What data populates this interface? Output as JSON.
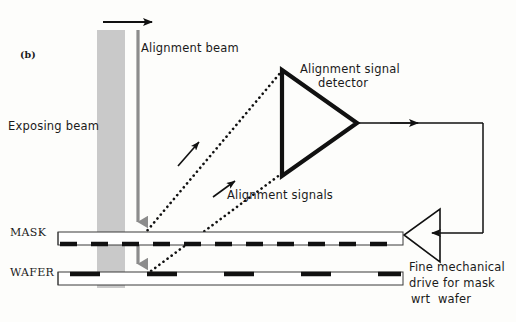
{
  "figure": {
    "panel_label": "(b)",
    "caption_absent": true
  },
  "labels": {
    "alignment_beam": "Alignment beam",
    "exposing_beam": "Exposing beam",
    "alignment_signal_detector_line1": "Alignment signal",
    "alignment_signal_detector_line2": "detector",
    "alignment_signals": "Alignment signals",
    "mask": "MASK",
    "wafer": "WAFER",
    "drive_line1": "Fine mechanical",
    "drive_line2": "drive for mask",
    "drive_line3": "wrt  wafer"
  },
  "colors": {
    "ink": "#1a1a1a",
    "beam_gray": "#c9c9c9",
    "alignment_beam_gray": "#8c8c8c",
    "background": "#fdfdfb",
    "dash_black": "#111111"
  },
  "geometry": {
    "exposing_beam": {
      "x": 97,
      "y": 30,
      "width": 28,
      "height": 258
    },
    "alignment_beam_line": {
      "x": 138,
      "y_top": 30,
      "y_bottom": 282
    },
    "top_arrow": {
      "x1": 103,
      "x2": 162,
      "y": 22
    },
    "mask_bar": {
      "x": 58,
      "y": 232,
      "width": 345,
      "height": 13
    },
    "wafer_bar": {
      "x": 58,
      "y": 272,
      "width": 345,
      "height": 13
    },
    "detector_triangle": {
      "apex_x": 358,
      "apex_y": 123,
      "back_x": 281,
      "top_y": 69,
      "bottom_y": 176
    },
    "drive_triangle": {
      "apex_x": 405,
      "apex_y": 233,
      "back_x": 440,
      "top_y": 209,
      "bottom_y": 262
    },
    "feedback_path": {
      "from_x": 358,
      "to_x": 483,
      "top_y": 123,
      "bottom_y": 233
    },
    "dotted_signal_1": {
      "x1": 140,
      "y1": 238,
      "x2": 281,
      "y2": 72
    },
    "dotted_signal_2": {
      "x1": 142,
      "y1": 277,
      "x2": 281,
      "y2": 174
    }
  },
  "icons": {
    "exposing_beam_block": "gray-beam-block-icon",
    "alignment_beam_arrow": "down-arrow-icon",
    "top_direction_arrow": "right-arrow-icon",
    "detector": "triangle-detector-icon",
    "drive": "triangle-actuator-icon",
    "signal_arrow": "diagonal-arrow-icon",
    "feedback_arrow": "left-arrow-icon"
  }
}
